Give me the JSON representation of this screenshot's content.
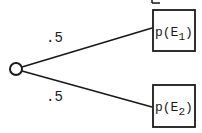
{
  "diagram": {
    "type": "probability-tree",
    "root": {
      "shape": "circle",
      "cx": 16,
      "cy": 69,
      "r": 6
    },
    "branches": [
      {
        "probability": ".5",
        "outcome": "p(E",
        "subscript": "1",
        "outcome_close": ")"
      },
      {
        "probability": ".5",
        "outcome": "p(E",
        "subscript": "2",
        "outcome_close": ")"
      }
    ],
    "colors": {
      "stroke": "#1a1a1a",
      "background": "#ffffff"
    }
  }
}
